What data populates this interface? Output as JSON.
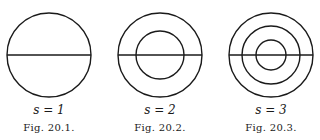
{
  "figures": [
    {
      "s_label": "s = 1",
      "caption": "Fig. 20.1.",
      "center": [
        49,
        55
      ],
      "radii": [
        42
      ]
    },
    {
      "s_label": "s = 2",
      "caption": "Fig. 20.2.",
      "center": [
        160,
        55
      ],
      "radii": [
        42,
        24
      ]
    },
    {
      "s_label": "s = 3",
      "caption": "Fig. 20.3.",
      "center": [
        271,
        55
      ],
      "radii": [
        42,
        29,
        15
      ]
    }
  ],
  "colors": {
    "stroke": "#1a1a1a",
    "background": "#ffffff"
  }
}
